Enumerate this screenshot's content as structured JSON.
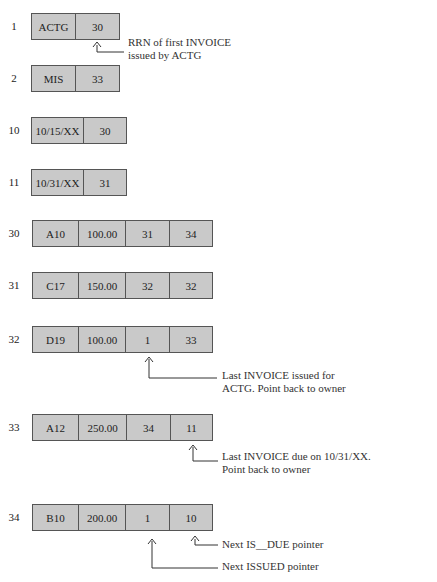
{
  "records": [
    {
      "rrn": "1",
      "cells": [
        "ACTG",
        "30"
      ]
    },
    {
      "rrn": "2",
      "cells": [
        "MIS",
        "33"
      ]
    },
    {
      "rrn": "10",
      "cells": [
        "10/15/XX",
        "30"
      ]
    },
    {
      "rrn": "11",
      "cells": [
        "10/31/XX",
        "31"
      ]
    },
    {
      "rrn": "30",
      "cells": [
        "A10",
        "100.00",
        "31",
        "34"
      ]
    },
    {
      "rrn": "31",
      "cells": [
        "C17",
        "150.00",
        "32",
        "32"
      ]
    },
    {
      "rrn": "32",
      "cells": [
        "D19",
        "100.00",
        "1",
        "33"
      ]
    },
    {
      "rrn": "33",
      "cells": [
        "A12",
        "250.00",
        "34",
        "11"
      ]
    },
    {
      "rrn": "34",
      "cells": [
        "B10",
        "200.00",
        "1",
        "10"
      ]
    }
  ],
  "annotations": {
    "first_invoice": [
      "RRN of first INVOICE",
      "issued by ACTG"
    ],
    "last_issued": [
      "Last INVOICE issued for",
      "ACTG.  Point back to owner"
    ],
    "last_due": [
      "Last INVOICE due on 10/31/XX.",
      "Point back to owner"
    ],
    "next_is_due": "Next IS__DUE pointer",
    "next_issued": "Next ISSUED pointer"
  },
  "colors": {
    "cell_fill": "#c9c9c9",
    "border": "#555555"
  }
}
